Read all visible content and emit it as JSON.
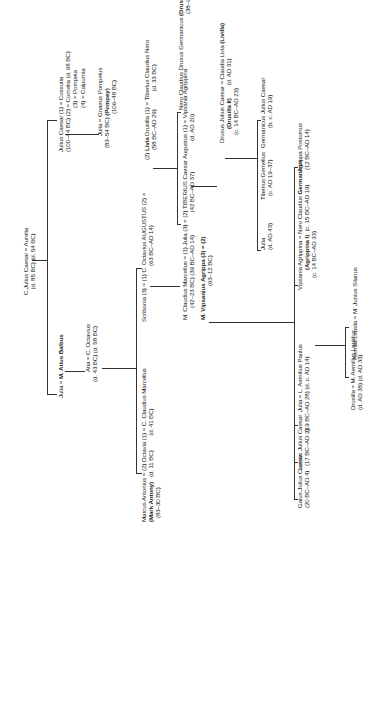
{
  "nodes": {
    "cjc": {
      "l1": "C.Julius Caesar = Aurelia",
      "l2": "(d. 85 BC)  (d. 54 BC)"
    },
    "julius": {
      "l1": "Julius Caesar (1) = Cossutia",
      "l2": "(100–44 BC) (2) = Cornelia (d. 68 BC)",
      "l3": "(3) = Pompeia",
      "l4": "(4) = Calpurnia"
    },
    "juliaPompey": {
      "l1": "Julia = Gnaeus Pompeius",
      "l2a": "(83–54 BC)",
      "l2b": "(Pompey)",
      "l3": "(106–48 BC)"
    },
    "juliaBalbus": {
      "l1a": "Julia = ",
      "l1b": "M. Atius Balbus"
    },
    "atia": {
      "l1": "Atia = C. Octavius",
      "l2": "(d. 43 BC)  (d. 58 BC)"
    },
    "antonius": {
      "l1": "Marcus Antonius = (2) Octavia (1) = C. Claudius Marcellus",
      "l2a": "(Mark Antony)",
      "l2b": "(d. 11 BC)",
      "l2c": "(d. 41 BC)",
      "l3": "(83–30 BC)"
    },
    "scribonia": {
      "l1": "Scribonia (3) = (1) C. Octavius AUGUSTUS (2) =",
      "l2": "(63 BC–AD 14)"
    },
    "livia": {
      "l1a": "(2) ",
      "l1b": "Livia",
      "l1c": " Drusilla (1) = Tiberius Claudius Nero",
      "l2": "(58 BC–AD 29)",
      "l2b": "(d. 33 BC)"
    },
    "drususGerm": {
      "l1a": "Nero Claudius Drusus Germanicus ",
      "l1b": "(Drusilla I)",
      "l1c": " = Antonia II",
      "l2": "(38–9 BC)  (36 BC–AD 37)"
    },
    "marcellus": {
      "l1": "M. Claudius Marcellus = (1) Julia (3) =  (2) TIBERIUS Caesar Augustus (1) = Vipsania Agrippina",
      "l2": "(42–23 BC)  (39 BC–AD 14)",
      "l2b": "(42 BC–AD 37)",
      "l2c": "(d. AD 20)"
    },
    "agrippa": {
      "l1": "M. Vipsanius Agrippa (3) = (2)",
      "l2": "(63–12 BC)"
    },
    "drususJC": {
      "l1": "Drusus Julius Caesar = Claudia Livia ",
      "l1b": "(Livilla)",
      "l2a": "(Drusilla II)",
      "l2b": "(d. AD 31)",
      "l3": "(c. 14 BC–AD 23)"
    },
    "juliaD43": {
      "l1": "Julia",
      "l2": "(d. AD 43)"
    },
    "gemellus": {
      "l1": "Tiberius Gemellus",
      "l2": "(c. AD 19–37)"
    },
    "germJC": {
      "l1": "Germanicus Julius Caesar",
      "l2": "(b. c. AD 19)"
    },
    "vipsania": {
      "l1a": "Vipsania Agrippina = Nero Claudius ",
      "l1b": "Germanicus",
      "l2a": "(Agrippina I)",
      "l2b": "(c. 15 BC–AD 19)",
      "l3": "(c. 14 BC–AD 33)"
    },
    "postumus": {
      "l1": "Agrippa Postumus",
      "l2": "(12 BC–AD 14)"
    },
    "gaius": {
      "l1": "Gaius Julius Caesar",
      "l2": "(20 BC–AD 4)"
    },
    "lucius": {
      "l1": "Lucius Julius Caesar",
      "l2": "(17 BC–AD 2)"
    },
    "juliaPaulus": {
      "l1": "Julia = L. Aemilius Paulus",
      "l2": "(19 BC–AD 28)  (d. c. AD 14)"
    },
    "drusilla": {
      "l1": "Drusilla = M. Aemilius Lepidus",
      "l2": "(d. AD 38)  (d. AD 33)"
    },
    "lepida": {
      "l1": "Aemilia Lepida = M. Junius Silanus"
    }
  }
}
